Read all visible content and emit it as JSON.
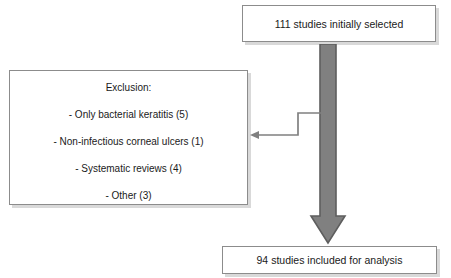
{
  "diagram": {
    "type": "flowchart",
    "colors": {
      "box_border": "#8c8c8c",
      "box_fill": "#ffffff",
      "arrow_fill": "#808080",
      "arrow_border": "#595959",
      "connector": "#808080",
      "text": "#1a1a1a"
    },
    "nodes": {
      "top_box": {
        "label": "111 studies initially selected",
        "count": 111
      },
      "exclusion_box": {
        "heading": "Exclusion:",
        "items": [
          "- Only bacterial keratitis (5)",
          "- Non-infectious corneal ulcers (1)",
          "- Systematic reviews (4)",
          "- Other (3)"
        ],
        "counts": [
          5,
          1,
          4,
          3
        ]
      },
      "bottom_box": {
        "label": "94 studies included for analysis",
        "count": 94
      }
    },
    "edges": [
      {
        "name": "main-flow-arrow",
        "from": "top_box",
        "to": "bottom_box",
        "style": "thick-block-arrow",
        "direction": "down"
      },
      {
        "name": "exclusion-branch-arrow",
        "from": "main-flow-arrow",
        "to": "exclusion_box",
        "style": "thin-elbow-arrow",
        "direction": "left"
      }
    ]
  }
}
